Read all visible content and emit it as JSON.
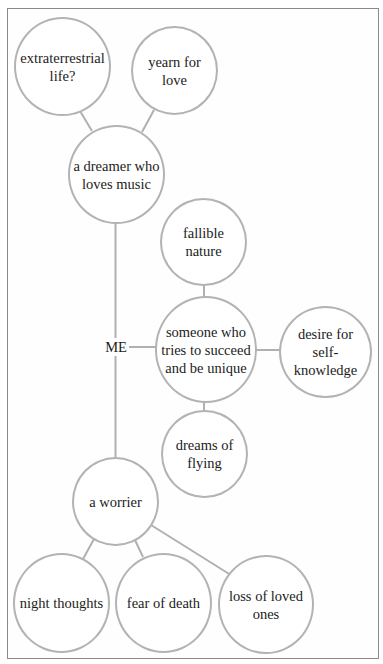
{
  "diagram": {
    "type": "concept-map",
    "center_label": "ME",
    "colors": {
      "line": "#b0b0b0",
      "circle_stroke": "#b3b3b3",
      "text": "#1c1c1c",
      "frame": "#8a8a8a"
    },
    "nodes": {
      "extraterrestrial": {
        "label": "extraterrestrial\nlife?"
      },
      "yearn": {
        "label": "yearn for\nlove"
      },
      "dreamer": {
        "label": "a dreamer who\nloves music"
      },
      "fallible": {
        "label": "fallible\nnature"
      },
      "someone": {
        "label": "someone who\ntries to succeed\nand be unique"
      },
      "desire": {
        "label": "desire for\nself-knowledge"
      },
      "dreams": {
        "label": "dreams of\nflying"
      },
      "worrier": {
        "label": "a worrier"
      },
      "night": {
        "label": "night thoughts"
      },
      "fear": {
        "label": "fear of death"
      },
      "loss": {
        "label": "loss of loved\nones"
      }
    },
    "edges": [
      [
        "extraterrestrial",
        "dreamer"
      ],
      [
        "yearn",
        "dreamer"
      ],
      [
        "dreamer",
        "ME"
      ],
      [
        "ME",
        "someone"
      ],
      [
        "ME",
        "worrier"
      ],
      [
        "fallible",
        "someone"
      ],
      [
        "someone",
        "desire"
      ],
      [
        "someone",
        "dreams"
      ],
      [
        "worrier",
        "night"
      ],
      [
        "worrier",
        "fear"
      ],
      [
        "worrier",
        "loss"
      ]
    ]
  }
}
